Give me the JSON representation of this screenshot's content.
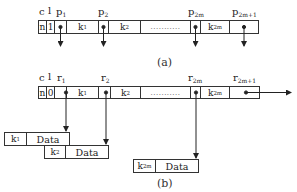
{
  "figure_a": {
    "caption": "(a)",
    "header_labels": {
      "c": "c",
      "l": "l",
      "p1": "p",
      "p1_sub": "1",
      "p2": "p",
      "p2_sub": "2",
      "p2m": "p",
      "p2m_sub": "2m",
      "p2m1": "p",
      "p2m1_sub": "2m+1"
    },
    "cells": {
      "n": "n",
      "l": "1",
      "k1": "k",
      "k1_sub": "1",
      "k2": "k",
      "k2_sub": "2",
      "dots": "...........",
      "k2m": "k",
      "k2m_sub": "2m"
    }
  },
  "figure_b": {
    "caption": "(b)",
    "header_labels": {
      "c": "c",
      "l": "l",
      "r1": "r",
      "r1_sub": "1",
      "r2": "r",
      "r2_sub": "2",
      "r2m": "r",
      "r2m_sub": "2m",
      "r2m1": "r",
      "r2m1_sub": "2m+1"
    },
    "cells": {
      "n": "n",
      "l": "0",
      "k1": "k",
      "k1_sub": "1",
      "k2": "k",
      "k2_sub": "2",
      "dots": "...........",
      "k2m": "k",
      "k2m_sub": "2m"
    },
    "data_records": [
      {
        "key": "k",
        "key_sub": "1",
        "value": "Data"
      },
      {
        "key": "k",
        "key_sub": "2",
        "value": "Data"
      },
      {
        "key": "k",
        "key_sub": "2m",
        "value": "Data"
      }
    ]
  },
  "colors": {
    "line": "#333333",
    "background": "#ffffff"
  }
}
